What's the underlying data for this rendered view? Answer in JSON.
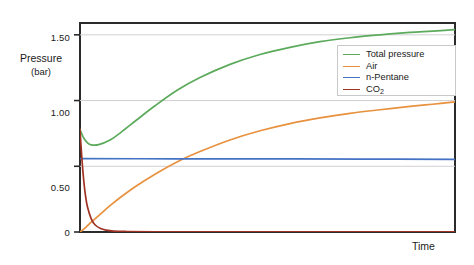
{
  "chart_data": {
    "type": "line",
    "title": "",
    "xlabel": "Time",
    "ylabel": "Pressure",
    "ylabel_units": "(bar)",
    "ylim": [
      0,
      1.59
    ],
    "xlim": [
      0,
      1
    ],
    "grid": true,
    "legend_position": "upper right",
    "ytick_labels": [
      "1.50",
      "1.00",
      "0.50",
      "0"
    ],
    "ytick_values": [
      1.5,
      1.0,
      0.5,
      0
    ],
    "xtick_labels": [],
    "series": [
      {
        "name": "Total pressure",
        "color": "#5caa5c",
        "x": [
          0.0,
          0.01,
          0.02,
          0.03,
          0.05,
          0.08,
          0.11,
          0.15,
          0.2,
          0.26,
          0.32,
          0.4,
          0.48,
          0.56,
          0.64,
          0.72,
          0.8,
          0.88,
          0.94,
          1.0
        ],
        "values": [
          0.78,
          0.715,
          0.678,
          0.663,
          0.665,
          0.7,
          0.76,
          0.85,
          0.96,
          1.08,
          1.175,
          1.275,
          1.35,
          1.405,
          1.448,
          1.478,
          1.5,
          1.518,
          1.528,
          1.54
        ]
      },
      {
        "name": "Air",
        "color": "#e8913f",
        "x": [
          0.0,
          0.01,
          0.02,
          0.03,
          0.05,
          0.08,
          0.11,
          0.15,
          0.2,
          0.26,
          0.32,
          0.4,
          0.48,
          0.56,
          0.64,
          0.72,
          0.8,
          0.88,
          0.94,
          1.0
        ],
        "values": [
          0.0,
          0.022,
          0.048,
          0.075,
          0.125,
          0.2,
          0.268,
          0.35,
          0.44,
          0.535,
          0.612,
          0.7,
          0.77,
          0.825,
          0.868,
          0.903,
          0.93,
          0.955,
          0.972,
          0.99
        ]
      },
      {
        "name": "n-Pentane",
        "color": "#4472c4",
        "x": [
          0.0,
          0.25,
          0.5,
          0.75,
          1.0
        ],
        "values": [
          0.558,
          0.557,
          0.556,
          0.555,
          0.553
        ]
      },
      {
        "name": "CO2",
        "display_name": "CO₂",
        "color": "#a03224",
        "x": [
          0.0,
          0.005,
          0.01,
          0.015,
          0.02,
          0.03,
          0.04,
          0.055,
          0.07,
          0.09,
          0.12,
          0.2,
          0.4,
          0.7,
          1.0
        ],
        "values": [
          0.78,
          0.56,
          0.39,
          0.27,
          0.19,
          0.1,
          0.055,
          0.026,
          0.014,
          0.007,
          0.004,
          0.002,
          0.001,
          0.001,
          0.001
        ]
      }
    ]
  },
  "axis": {
    "ylabel_line1": "Pressure",
    "ylabel_line2": "(bar)",
    "xlabel": "Time",
    "ytick_1": "1.50",
    "ytick_2": "1.00",
    "ytick_3": "0.50",
    "ytick_4": "0"
  },
  "legend": {
    "items": [
      {
        "label": "Total pressure",
        "color": "#5caa5c"
      },
      {
        "label": "Air",
        "color": "#e8913f"
      },
      {
        "label": "n-Pentane",
        "color": "#4472c4"
      },
      {
        "label": "CO",
        "sub": "2",
        "color": "#a03224"
      }
    ]
  },
  "colors": {
    "total_pressure": "#5caa5c",
    "air": "#e8913f",
    "n_pentane": "#4472c4",
    "co2": "#a03224",
    "axis": "#2b2b2b",
    "grid": "#d0d0d0",
    "background": "#ffffff"
  }
}
